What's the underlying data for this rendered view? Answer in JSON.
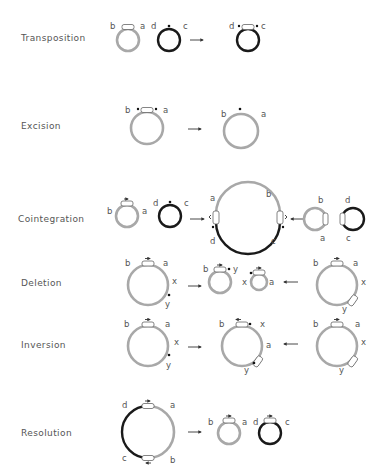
{
  "figure": {
    "rows": [
      {
        "id": "transposition",
        "label": "Transposition"
      },
      {
        "id": "excision",
        "label": "Excision"
      },
      {
        "id": "cointegration",
        "label": "Cointegration"
      },
      {
        "id": "deletion",
        "label": "Deletion"
      },
      {
        "id": "inversion",
        "label": "Inversion"
      },
      {
        "id": "resolution",
        "label": "Resolution"
      }
    ],
    "site_labels": {
      "a": "a",
      "b": "b",
      "c": "c",
      "d": "d",
      "x": "x",
      "y": "y"
    },
    "colors": {
      "donor_dna": "#a8a8a8",
      "target_dna": "#1a1a1a",
      "background": "#ffffff"
    }
  }
}
